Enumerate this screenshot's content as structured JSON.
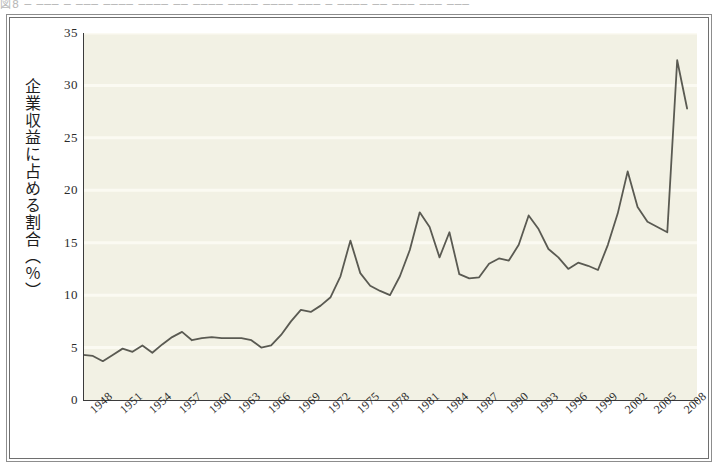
{
  "figure": {
    "top_caption": "図8  ─  ───  ─ ───  ──── ──── ── ──── ──── ──── ─── ─  ──── ── ─── ─── ───",
    "frame_style": "double-rule",
    "plot_background": "#f2f1e4",
    "line_color": "#5a5a52"
  },
  "chart_data": {
    "type": "line",
    "title": "",
    "xlabel": "",
    "ylabel": "企業収益に占める割合（％）",
    "ylabel_chars": [
      "企",
      "業",
      "収",
      "益",
      "に",
      "占",
      "め",
      "る",
      "割",
      "合",
      "（",
      "%",
      "）"
    ],
    "xlim": [
      1947,
      2009
    ],
    "ylim": [
      0,
      35
    ],
    "yticks": [
      0,
      5,
      10,
      15,
      20,
      25,
      30,
      35
    ],
    "xticks": [
      1948,
      1951,
      1954,
      1957,
      1960,
      1963,
      1966,
      1969,
      1972,
      1975,
      1978,
      1981,
      1984,
      1987,
      1990,
      1993,
      1996,
      1999,
      2002,
      2005,
      2008
    ],
    "grid": true,
    "grid_axis": "y",
    "legend": null,
    "series": [
      {
        "name": "企業収益に占める割合",
        "x": [
          1947,
          1948,
          1949,
          1950,
          1951,
          1952,
          1953,
          1954,
          1955,
          1956,
          1957,
          1958,
          1959,
          1960,
          1961,
          1962,
          1963,
          1964,
          1965,
          1966,
          1967,
          1968,
          1969,
          1970,
          1971,
          1972,
          1973,
          1974,
          1975,
          1976,
          1977,
          1978,
          1979,
          1980,
          1981,
          1982,
          1983,
          1984,
          1985,
          1986,
          1987,
          1988,
          1989,
          1990,
          1991,
          1992,
          1993,
          1994,
          1995,
          1996,
          1997,
          1998,
          1999,
          2000,
          2001,
          2002,
          2003,
          2004,
          2005,
          2006,
          2007,
          2008
        ],
        "values": [
          4.3,
          4.2,
          3.7,
          4.3,
          4.9,
          4.6,
          5.2,
          4.5,
          5.3,
          6.0,
          6.5,
          5.7,
          5.9,
          6.0,
          5.9,
          5.9,
          5.9,
          5.7,
          5.0,
          5.2,
          6.2,
          7.5,
          8.6,
          8.4,
          9.0,
          9.8,
          11.8,
          15.2,
          12.1,
          10.9,
          10.4,
          10.0,
          11.8,
          14.3,
          17.9,
          16.5,
          13.6,
          16.0,
          12.0,
          11.6,
          11.7,
          13.0,
          13.5,
          13.3,
          14.8,
          17.6,
          16.3,
          14.4,
          13.6,
          12.5,
          13.1,
          12.8,
          12.4,
          14.8,
          17.8,
          21.8,
          18.4,
          17.0,
          16.5,
          16.0,
          32.4,
          27.8
        ]
      }
    ]
  }
}
